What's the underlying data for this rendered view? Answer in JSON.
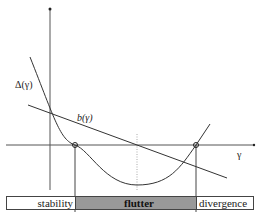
{
  "diagram": {
    "labels": {
      "delta_curve": "Δ(γ)",
      "b_line": "b(γ)",
      "x_axis": "γ"
    },
    "regions": [
      {
        "name": "stability",
        "label": "stability",
        "fill": "#ffffff"
      },
      {
        "name": "flutter",
        "label": "flutter",
        "fill": "#999999"
      },
      {
        "name": "divergence",
        "label": "divergence",
        "fill": "#ffffff"
      }
    ],
    "colors": {
      "line": "#333333",
      "axis": "#555555",
      "flutter_fill": "#999999"
    }
  }
}
